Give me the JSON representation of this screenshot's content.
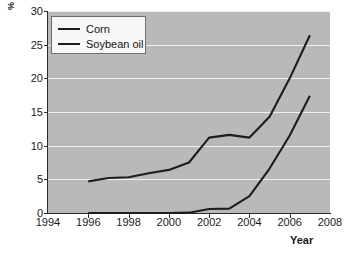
{
  "chart_data": {
    "type": "line",
    "title": "",
    "xlabel": "Year",
    "ylabel": "%",
    "xlim": [
      1994,
      2008
    ],
    "ylim": [
      0,
      30
    ],
    "xticks": [
      1994,
      1996,
      1998,
      2000,
      2002,
      2004,
      2006,
      2008
    ],
    "yticks": [
      0,
      5,
      10,
      15,
      20,
      25,
      30
    ],
    "grid": "horizontal",
    "legend_position": "upper left",
    "x": [
      1996,
      1997,
      1998,
      1999,
      2000,
      2001,
      2002,
      2003,
      2004,
      2005,
      2006,
      2007
    ],
    "series": [
      {
        "name": "Corn",
        "color": "#1d1d1d",
        "values": [
          4.7,
          5.2,
          5.3,
          5.9,
          6.4,
          7.5,
          11.2,
          11.6,
          11.2,
          14.3,
          20.0,
          26.4
        ]
      },
      {
        "name": "Soybean oil",
        "color": "#1d1d1d",
        "values": [
          0.0,
          0.0,
          0.0,
          0.0,
          0.0,
          0.05,
          0.6,
          0.65,
          2.5,
          6.6,
          11.5,
          17.4
        ]
      }
    ]
  },
  "axes": {
    "y_label": "%",
    "x_label": "Year",
    "y_tick_labels": [
      "0",
      "5",
      "10",
      "15",
      "20",
      "25",
      "30"
    ],
    "x_tick_labels": [
      "1994",
      "1996",
      "1998",
      "2000",
      "2002",
      "2004",
      "2006",
      "2008"
    ]
  },
  "legend": {
    "entries": [
      {
        "label": "Corn"
      },
      {
        "label": "Soybean oil"
      }
    ]
  },
  "colors": {
    "plot_background": "#b9b9b9",
    "gridline": "#efefef",
    "line": "#1d1d1d",
    "axis": "#2b2b2b",
    "legend_background": "#f7f7f7",
    "legend_border": "#6f6f6f",
    "page_background": "#ffffff"
  }
}
